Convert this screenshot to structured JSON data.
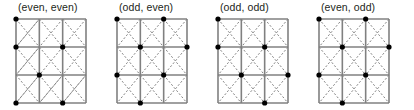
{
  "figure": {
    "title": "",
    "background": "#ffffff",
    "width": 414,
    "height": 110
  },
  "style": {
    "grid_line_color": "#808080",
    "diagonal_line_color": "#808080",
    "dot_color": "#000000",
    "label_color": "#231f20",
    "grid_line_width": 1.6,
    "diagonal_dash": "2,2",
    "dot_radius": 2.6
  },
  "panels": [
    {
      "id": "panel-even-even",
      "label": "(even, even)",
      "left": 0,
      "grid": {
        "cols": 3,
        "rows": 3,
        "cell_w": 23.333,
        "cell_h": 28
      },
      "diagonals": [
        [
          0,
          0,
          1,
          1
        ],
        [
          1,
          1,
          2,
          2
        ],
        [
          2,
          2,
          3,
          3
        ],
        [
          1,
          0,
          0,
          1
        ],
        [
          2,
          0,
          1,
          1
        ],
        [
          3,
          0,
          2,
          1
        ],
        [
          1,
          1,
          0,
          2
        ],
        [
          2,
          1,
          1,
          2
        ],
        [
          3,
          1,
          2,
          2
        ],
        [
          1,
          2,
          0,
          3
        ],
        [
          2,
          2,
          1,
          3
        ],
        [
          3,
          2,
          2,
          3
        ],
        [
          0,
          1,
          1,
          2
        ],
        [
          1,
          2,
          2,
          3
        ],
        [
          0,
          2,
          1,
          3
        ],
        [
          1,
          0,
          2,
          1
        ],
        [
          2,
          1,
          3,
          2
        ],
        [
          2,
          0,
          3,
          1
        ],
        [
          0,
          1,
          1,
          0
        ],
        [
          0,
          2,
          1,
          1
        ],
        [
          0,
          3,
          1,
          2
        ],
        [
          1,
          3,
          2,
          2
        ],
        [
          2,
          3,
          3,
          2
        ]
      ],
      "dots": [
        [
          0,
          0
        ],
        [
          0,
          1
        ],
        [
          2,
          1
        ],
        [
          1,
          2
        ],
        [
          0,
          3
        ],
        [
          2,
          3
        ]
      ]
    },
    {
      "id": "panel-odd-even",
      "label": "(odd, even)",
      "left": 101,
      "grid": {
        "cols": 3,
        "rows": 3,
        "cell_w": 23.333,
        "cell_h": 28
      },
      "diagonals": [
        [
          0,
          0,
          1,
          1
        ],
        [
          1,
          1,
          2,
          2
        ],
        [
          2,
          2,
          3,
          3
        ],
        [
          1,
          0,
          0,
          1
        ],
        [
          2,
          0,
          1,
          1
        ],
        [
          3,
          0,
          2,
          1
        ],
        [
          1,
          1,
          0,
          2
        ],
        [
          2,
          1,
          1,
          2
        ],
        [
          3,
          1,
          2,
          2
        ],
        [
          1,
          2,
          0,
          3
        ],
        [
          2,
          2,
          1,
          3
        ],
        [
          3,
          2,
          2,
          3
        ],
        [
          0,
          1,
          1,
          2
        ],
        [
          1,
          2,
          2,
          3
        ],
        [
          0,
          2,
          1,
          3
        ],
        [
          1,
          0,
          2,
          1
        ],
        [
          2,
          1,
          3,
          2
        ],
        [
          2,
          0,
          3,
          1
        ]
      ],
      "dots": [
        [
          0,
          0
        ],
        [
          2,
          0
        ],
        [
          1,
          1
        ],
        [
          0,
          2
        ],
        [
          2,
          2
        ],
        [
          1,
          3
        ],
        [
          3,
          1
        ]
      ]
    },
    {
      "id": "panel-odd-odd",
      "label": "(odd, odd)",
      "left": 202,
      "grid": {
        "cols": 3,
        "rows": 3,
        "cell_w": 23.333,
        "cell_h": 28
      },
      "diagonals": [
        [
          0,
          0,
          1,
          1
        ],
        [
          1,
          1,
          2,
          2
        ],
        [
          2,
          2,
          3,
          3
        ],
        [
          1,
          0,
          0,
          1
        ],
        [
          2,
          0,
          1,
          1
        ],
        [
          3,
          0,
          2,
          1
        ],
        [
          1,
          1,
          0,
          2
        ],
        [
          2,
          1,
          1,
          2
        ],
        [
          3,
          1,
          2,
          2
        ],
        [
          1,
          2,
          0,
          3
        ],
        [
          2,
          2,
          1,
          3
        ],
        [
          3,
          2,
          2,
          3
        ],
        [
          0,
          1,
          1,
          2
        ],
        [
          1,
          2,
          2,
          3
        ],
        [
          0,
          2,
          1,
          3
        ],
        [
          1,
          0,
          2,
          1
        ],
        [
          2,
          1,
          3,
          2
        ],
        [
          2,
          0,
          3,
          1
        ]
      ],
      "dots": [
        [
          0,
          0
        ],
        [
          0,
          1
        ],
        [
          2,
          1
        ],
        [
          1,
          2
        ],
        [
          3,
          2
        ],
        [
          2,
          3
        ]
      ]
    },
    {
      "id": "panel-even-odd",
      "label": "(even, odd)",
      "left": 303,
      "grid": {
        "cols": 3,
        "rows": 3,
        "cell_w": 23.333,
        "cell_h": 28
      },
      "diagonals": [
        [
          0,
          0,
          1,
          1
        ],
        [
          1,
          1,
          2,
          2
        ],
        [
          2,
          2,
          3,
          3
        ],
        [
          1,
          0,
          0,
          1
        ],
        [
          2,
          0,
          1,
          1
        ],
        [
          3,
          0,
          2,
          1
        ],
        [
          1,
          1,
          0,
          2
        ],
        [
          2,
          1,
          1,
          2
        ],
        [
          3,
          1,
          2,
          2
        ],
        [
          1,
          2,
          0,
          3
        ],
        [
          2,
          2,
          1,
          3
        ],
        [
          3,
          2,
          2,
          3
        ],
        [
          0,
          1,
          1,
          2
        ],
        [
          1,
          2,
          2,
          3
        ],
        [
          0,
          2,
          1,
          3
        ],
        [
          1,
          0,
          2,
          1
        ],
        [
          2,
          1,
          3,
          2
        ],
        [
          2,
          0,
          3,
          1
        ]
      ],
      "dots": [
        [
          0,
          0
        ],
        [
          2,
          0
        ],
        [
          1,
          1
        ],
        [
          3,
          1
        ],
        [
          0,
          2
        ],
        [
          2,
          2
        ],
        [
          1,
          3
        ]
      ]
    }
  ]
}
